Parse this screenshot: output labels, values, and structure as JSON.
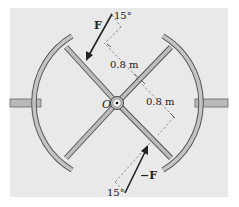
{
  "figure": {
    "type": "mechanics-diagram",
    "colors": {
      "background": "#e9e9e9",
      "member_fill": "#b9b9b9",
      "member_edge": "#555555",
      "arrow": "#222222",
      "dashed": "#666666"
    },
    "labels": {
      "force_top": "F",
      "force_bottom": "−F",
      "angle_top": "15°",
      "angle_bottom": "15°",
      "dist_1": "0.8 m",
      "dist_2": "0.8 m",
      "center": "O"
    }
  }
}
